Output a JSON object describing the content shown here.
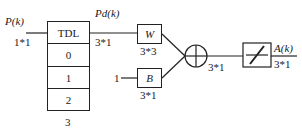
{
  "input": {
    "label": "P(k)",
    "dims": "1*1"
  },
  "tdl": {
    "title": "TDL",
    "cells": [
      "0",
      "1",
      "2"
    ],
    "count": "3"
  },
  "delayed": {
    "label": "Pd(k)",
    "dims": "3*1"
  },
  "weight": {
    "label": "W",
    "dims": "3*3"
  },
  "bias": {
    "label": "B",
    "dims": "3*1",
    "input": "1"
  },
  "sum": {
    "dims": "3*1",
    "icon": "summing-junction"
  },
  "transfer": {
    "icon": "linear-transfer-function"
  },
  "output": {
    "label": "A(k)",
    "dims": "3*1"
  }
}
